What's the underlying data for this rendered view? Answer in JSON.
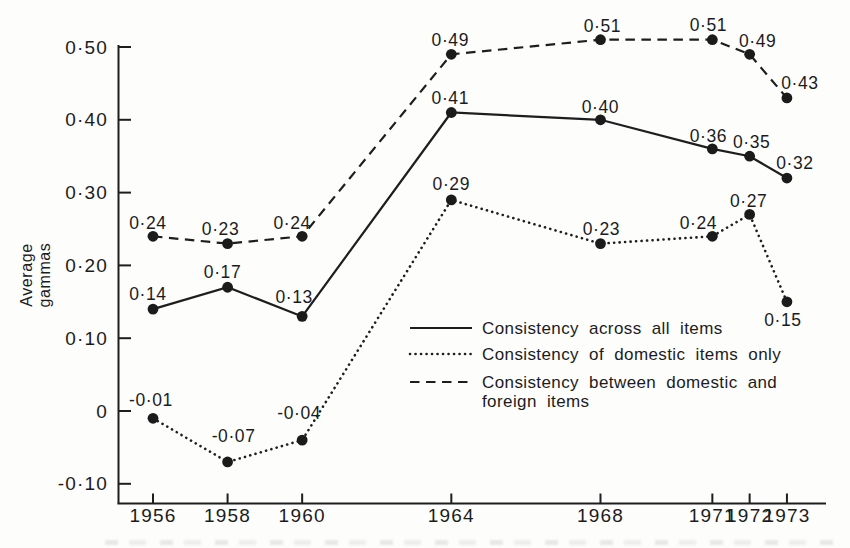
{
  "chart_data": {
    "type": "line",
    "title": "",
    "xlabel": "",
    "ylabel": "Average gammas",
    "grid": false,
    "legend_position": "inside lower-right of plot",
    "xlim": [
      1955,
      1974.5
    ],
    "ylim": [
      -0.155,
      0.555
    ],
    "x_years": [
      1956,
      1958,
      1960,
      1964,
      1968,
      1971,
      1972,
      1973
    ],
    "x_tick_labels": [
      "1956",
      "1958",
      "1960",
      "1964",
      "1968",
      "1971",
      "1972",
      "1973"
    ],
    "y_ticks": [
      {
        "value": 0.5,
        "label": "0·50"
      },
      {
        "value": 0.4,
        "label": "0·40"
      },
      {
        "value": 0.3,
        "label": "0·30"
      },
      {
        "value": 0.2,
        "label": "0·20"
      },
      {
        "value": 0.1,
        "label": "0·10"
      },
      {
        "value": 0,
        "label": "0"
      },
      {
        "value": -0.1,
        "label": "-0·10"
      }
    ],
    "series": [
      {
        "name": "Consistency across all items",
        "style": "solid",
        "points": [
          {
            "year": 1956,
            "value": 0.14,
            "label": "0·14",
            "dx": -5,
            "dy": -9
          },
          {
            "year": 1958,
            "value": 0.17,
            "label": "0·17",
            "dx": -5,
            "dy": -9
          },
          {
            "year": 1960,
            "value": 0.13,
            "label": "0·13",
            "dx": -8,
            "dy": -13
          },
          {
            "year": 1964,
            "value": 0.41,
            "label": "0·41",
            "dx": -1,
            "dy": -9
          },
          {
            "year": 1968,
            "value": 0.4,
            "label": "0·40",
            "dx": 0,
            "dy": -7
          },
          {
            "year": 1971,
            "value": 0.36,
            "label": "0·36",
            "dx": -4,
            "dy": -7
          },
          {
            "year": 1972,
            "value": 0.35,
            "label": "0·35",
            "dx": 2,
            "dy": -8
          },
          {
            "year": 1973,
            "value": 0.32,
            "label": "0·32",
            "dx": 8,
            "dy": -9
          }
        ]
      },
      {
        "name": "Consistency of domestic items only",
        "style": "dotted",
        "points": [
          {
            "year": 1956,
            "value": -0.01,
            "label": "-0·01",
            "dx": -2,
            "dy": -12
          },
          {
            "year": 1958,
            "value": -0.07,
            "label": "-0·07",
            "dx": 6,
            "dy": -20
          },
          {
            "year": 1960,
            "value": -0.04,
            "label": "-0·04",
            "dx": -3,
            "dy": -21
          },
          {
            "year": 1964,
            "value": 0.29,
            "label": "0·29",
            "dx": 0,
            "dy": -10
          },
          {
            "year": 1968,
            "value": 0.23,
            "label": "0·23",
            "dx": 1,
            "dy": -9
          },
          {
            "year": 1971,
            "value": 0.24,
            "label": "0·24",
            "dx": -14,
            "dy": -7
          },
          {
            "year": 1972,
            "value": 0.27,
            "label": "0·27",
            "dx": -1,
            "dy": -7
          },
          {
            "year": 1973,
            "value": 0.15,
            "label": "0·15",
            "dx": -4,
            "dy": 24
          }
        ]
      },
      {
        "name": "Consistency between domestic and foreign items",
        "style": "dashed",
        "points": [
          {
            "year": 1956,
            "value": 0.24,
            "label": "0·24",
            "dx": -5,
            "dy": -7
          },
          {
            "year": 1958,
            "value": 0.23,
            "label": "0·23",
            "dx": -7,
            "dy": -9
          },
          {
            "year": 1960,
            "value": 0.24,
            "label": "0·24",
            "dx": -10,
            "dy": -7
          },
          {
            "year": 1964,
            "value": 0.49,
            "label": "0·49",
            "dx": -1,
            "dy": -8
          },
          {
            "year": 1968,
            "value": 0.51,
            "label": "0·51",
            "dx": 2,
            "dy": -8
          },
          {
            "year": 1971,
            "value": 0.51,
            "label": "0·51",
            "dx": -4,
            "dy": -9
          },
          {
            "year": 1972,
            "value": 0.49,
            "label": "0·49",
            "dx": 8,
            "dy": -7
          },
          {
            "year": 1973,
            "value": 0.43,
            "label": "0·43",
            "dx": 13,
            "dy": -9
          }
        ]
      }
    ],
    "legend": {
      "rows": [
        {
          "style": "solid",
          "label": "Consistency across all items"
        },
        {
          "style": "dotted",
          "label": "Consistency of domestic items only"
        },
        {
          "style": "dashed",
          "label": "Consistency between domestic and",
          "label2": "foreign items"
        }
      ]
    },
    "colors": {
      "ink": "#1e1e1e",
      "paper": "#fdfdfc"
    }
  }
}
